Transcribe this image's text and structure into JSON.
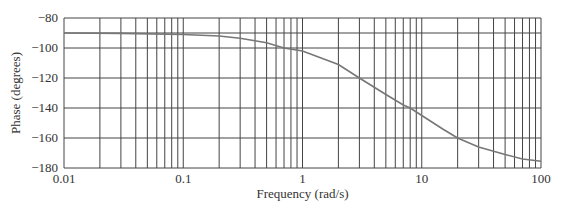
{
  "chart_data": {
    "type": "line",
    "title": "",
    "xlabel": "Frequency (rad/s)",
    "ylabel": "Phase (degrees)",
    "xscale": "log",
    "xlim": [
      0.01,
      100
    ],
    "ylim": [
      -180,
      -80
    ],
    "grid": true,
    "x_tick_labels": [
      "0.01",
      "0.1",
      "1",
      "10",
      "100"
    ],
    "y_tick_labels": [
      "-80",
      "-100",
      "-120",
      "-140",
      "-160",
      "-180"
    ],
    "series": [
      {
        "name": "phase",
        "x": [
          0.01,
          0.03,
          0.1,
          0.2,
          0.3,
          0.5,
          0.7,
          1,
          2,
          3,
          5,
          7,
          8,
          10,
          15,
          20,
          30,
          50,
          70,
          100
        ],
        "y": [
          -90,
          -90.3,
          -91,
          -92,
          -93.5,
          -96.5,
          -100,
          -102,
          -111,
          -120,
          -131,
          -138,
          -140,
          -145,
          -154,
          -160,
          -166,
          -171,
          -174,
          -175.5
        ]
      }
    ],
    "curve_color": "#777777"
  },
  "axes": {
    "xlabel": "Frequency (rad/s)",
    "ylabel": "Phase (degrees)"
  }
}
